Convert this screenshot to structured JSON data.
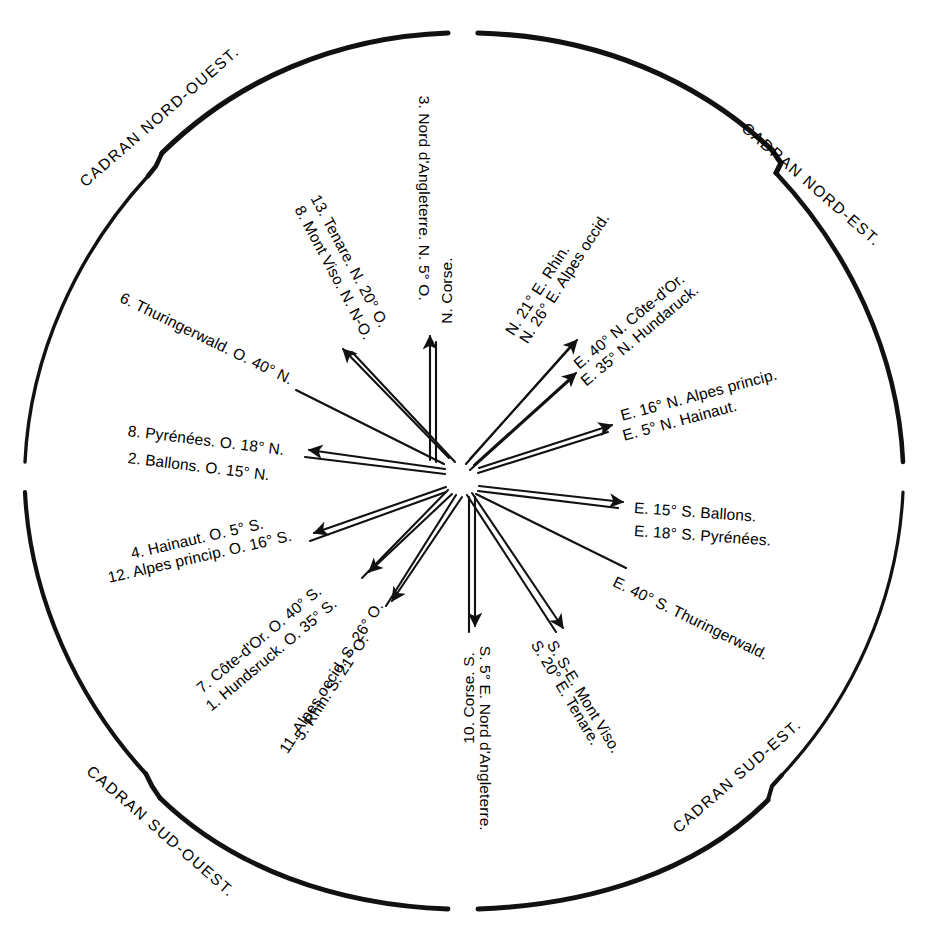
{
  "figure": {
    "type": "wind-rose-diagram",
    "ink_color": "#111111",
    "background": "#ffffff",
    "center": {
      "x": 462,
      "y": 477
    },
    "radius": 445
  },
  "quadrants": [
    {
      "id": "nw",
      "label": "CADRAN NORD-OUEST."
    },
    {
      "id": "ne",
      "label": "CADRAN NORD-EST."
    },
    {
      "id": "sw",
      "label": "CADRAN SUD-OUEST."
    },
    {
      "id": "se",
      "label": "CADRAN SUD-EST."
    }
  ],
  "rays": [
    {
      "id": "ray-tenare-n20o",
      "text": "13. Tenare. N. 20° O."
    },
    {
      "id": "ray-montviso-nno",
      "text": "8. Mont Viso. N. N-O."
    },
    {
      "id": "ray-nordangleterre-n5o",
      "text": "3. Nord d'Angleterre. N. 5° O."
    },
    {
      "id": "ray-ncorse",
      "text": "N. Corse."
    },
    {
      "id": "ray-n21e-rhin",
      "text": "N. 21° E. Rhin."
    },
    {
      "id": "ray-n26e-alpesoccid",
      "text": "N. 26° E. Alpes occid."
    },
    {
      "id": "ray-e40n-cotedor",
      "text": "E. 40° N. Côte-d'Or."
    },
    {
      "id": "ray-e35n-hundaruck",
      "text": "E. 35° N. Hundaruck."
    },
    {
      "id": "ray-e16n-alpesprincip",
      "text": "E. 16° N. Alpes princip."
    },
    {
      "id": "ray-e5n-hainaut",
      "text": "E. 5° N. Hainaut."
    },
    {
      "id": "ray-e15s-ballons",
      "text": "E. 15° S. Ballons."
    },
    {
      "id": "ray-e18s-pyrenees",
      "text": "E. 18° S. Pyrénées."
    },
    {
      "id": "ray-e40s-thuringerwald",
      "text": "E. 40° S. Thuringerwald."
    },
    {
      "id": "ray-sse-montviso",
      "text": "S. S-E. Mont Viso."
    },
    {
      "id": "ray-s20e-tenare",
      "text": "S. 20° E. Tenare."
    },
    {
      "id": "ray-s5e-nordangleterre",
      "text": "S. 5° E. Nord d'Angleterre."
    },
    {
      "id": "ray-corse-s",
      "text": "10. Corse. S."
    },
    {
      "id": "ray-rhin-s21o",
      "text": "5. Rhin. S. 21° O."
    },
    {
      "id": "ray-alpesoccid-s26o",
      "text": "11. Alpes occid. S. 26° O."
    },
    {
      "id": "ray-hundsruck-o35s",
      "text": "1. Hundsruck. O. 35° S."
    },
    {
      "id": "ray-cotedor-o40s",
      "text": "7. Côte-d'Or. O. 40° S."
    },
    {
      "id": "ray-hainaut-o5s",
      "text": "4. Hainaut. O. 5° S."
    },
    {
      "id": "ray-alpesprincip-o16s",
      "text": "12. Alpes princip. O. 16° S."
    },
    {
      "id": "ray-pyrenees-o18n",
      "text": "8. Pyrénées. O. 18° N."
    },
    {
      "id": "ray-ballons-o15n",
      "text": "2. Ballons. O. 15° N."
    },
    {
      "id": "ray-thuringerwald-o40n",
      "text": "6. Thuringerwald. O. 40° N."
    }
  ]
}
